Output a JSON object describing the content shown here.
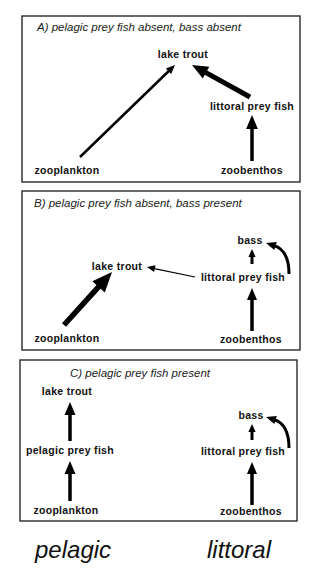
{
  "panels": [
    {
      "id": "A",
      "title": "A) pelagic prey fish absent, bass absent",
      "box": {
        "x": 22,
        "y": 16,
        "w": 278,
        "h": 166
      },
      "title_pos": {
        "x": 37,
        "y": 31
      },
      "nodes": [
        {
          "id": "lake_trout",
          "label": "lake trout",
          "x": 183,
          "y": 58
        },
        {
          "id": "littoral_prey_fish",
          "label": "littoral prey fish",
          "x": 252,
          "y": 110
        },
        {
          "id": "zooplankton",
          "label": "zooplankton",
          "x": 67,
          "y": 174
        },
        {
          "id": "zoobenthos",
          "label": "zoobenthos",
          "x": 252,
          "y": 174
        }
      ],
      "edges": [
        {
          "from": "zooplankton",
          "to": "lake_trout",
          "x1": 80,
          "y1": 157,
          "x2": 175,
          "y2": 65,
          "width": 2.5,
          "head": 9,
          "curve": false
        },
        {
          "from": "littoral_prey_fish",
          "to": "lake_trout",
          "x1": 250,
          "y1": 97,
          "x2": 192,
          "y2": 65,
          "width": 5,
          "head": 16,
          "curve": false
        },
        {
          "from": "zoobenthos",
          "to": "littoral_prey_fish",
          "x1": 252,
          "y1": 161,
          "x2": 252,
          "y2": 115,
          "width": 3.5,
          "head": 14,
          "curve": false
        }
      ]
    },
    {
      "id": "B",
      "title": "B) pelagic prey fish absent, bass present",
      "box": {
        "x": 22,
        "y": 191,
        "w": 278,
        "h": 159
      },
      "title_pos": {
        "x": 34,
        "y": 207
      },
      "nodes": [
        {
          "id": "bass",
          "label": "bass",
          "x": 250,
          "y": 244
        },
        {
          "id": "lake_trout",
          "label": "lake trout",
          "x": 117,
          "y": 270
        },
        {
          "id": "littoral_prey_fish",
          "label": "littoral prey fish",
          "x": 243,
          "y": 281
        },
        {
          "id": "zooplankton",
          "label": "zooplankton",
          "x": 67,
          "y": 342
        },
        {
          "id": "zoobenthos",
          "label": "zoobenthos",
          "x": 251,
          "y": 343
        }
      ],
      "edges": [
        {
          "from": "zooplankton",
          "to": "lake_trout",
          "x1": 64,
          "y1": 325,
          "x2": 112,
          "y2": 272,
          "width": 5.5,
          "head": 20,
          "curve": false
        },
        {
          "from": "littoral_prey_fish",
          "to": "lake_trout",
          "x1": 195,
          "y1": 277,
          "x2": 147,
          "y2": 267,
          "width": 1.2,
          "head": 8,
          "curve": false
        },
        {
          "from": "littoral_prey_fish",
          "to": "bass",
          "x1": 252,
          "y1": 264,
          "x2": 252,
          "y2": 249,
          "width": 3,
          "head": 8,
          "curve": false
        },
        {
          "from": "zoobenthos",
          "to": "littoral_prey_fish",
          "x1": 252,
          "y1": 331,
          "x2": 252,
          "y2": 288,
          "width": 3.5,
          "head": 12,
          "curve": false
        },
        {
          "from": "bass",
          "to": "bass",
          "x1": 289,
          "y1": 274,
          "x2": 266,
          "y2": 243,
          "cx": 289,
          "cy": 250,
          "width": 3,
          "head": 10,
          "curve": true
        }
      ]
    },
    {
      "id": "C",
      "title": "C) pelagic prey fish present",
      "box": {
        "x": 20,
        "y": 360,
        "w": 277,
        "h": 161
      },
      "title_pos": {
        "x": 70,
        "y": 377
      },
      "nodes": [
        {
          "id": "lake_trout",
          "label": "lake trout",
          "x": 67,
          "y": 395
        },
        {
          "id": "bass",
          "label": "bass",
          "x": 251,
          "y": 419
        },
        {
          "id": "pelagic_prey_fish",
          "label": "pelagic prey fish",
          "x": 70,
          "y": 454
        },
        {
          "id": "littoral_prey_fish",
          "label": "littoral prey fish",
          "x": 243,
          "y": 455
        },
        {
          "id": "zooplankton",
          "label": "zooplankton",
          "x": 66,
          "y": 514
        },
        {
          "id": "zoobenthos",
          "label": "zoobenthos",
          "x": 251,
          "y": 515
        }
      ],
      "edges": [
        {
          "from": "pelagic_prey_fish",
          "to": "lake_trout",
          "x1": 70,
          "y1": 441,
          "x2": 70,
          "y2": 402,
          "width": 3.5,
          "head": 13,
          "curve": false
        },
        {
          "from": "zooplankton",
          "to": "pelagic_prey_fish",
          "x1": 70,
          "y1": 501,
          "x2": 70,
          "y2": 461,
          "width": 3.5,
          "head": 13,
          "curve": false
        },
        {
          "from": "littoral_prey_fish",
          "to": "bass",
          "x1": 252,
          "y1": 440,
          "x2": 252,
          "y2": 424,
          "width": 3,
          "head": 8,
          "curve": false
        },
        {
          "from": "zoobenthos",
          "to": "littoral_prey_fish",
          "x1": 252,
          "y1": 505,
          "x2": 252,
          "y2": 462,
          "width": 3.5,
          "head": 12,
          "curve": false
        },
        {
          "from": "bass",
          "to": "bass",
          "x1": 289,
          "y1": 448,
          "x2": 266,
          "y2": 417,
          "cx": 289,
          "cy": 424,
          "width": 3,
          "head": 10,
          "curve": true
        }
      ]
    }
  ],
  "habitat_labels": [
    {
      "label": "pelagic",
      "x": 35,
      "y": 558
    },
    {
      "label": "littoral",
      "x": 207,
      "y": 558
    }
  ]
}
